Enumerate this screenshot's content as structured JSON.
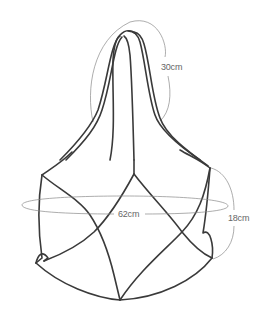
{
  "figure": {
    "colors": {
      "strand": "#3a3a3a",
      "measure_line": "#8a8a8a",
      "label_text": "#666666",
      "background": "#ffffff"
    }
  },
  "measurements": {
    "handle_length": "30cm",
    "circumference": "62cm",
    "body_height": "18cm"
  }
}
